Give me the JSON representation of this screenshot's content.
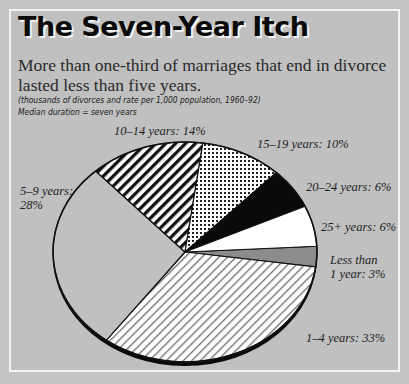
{
  "header": {
    "title": "The Seven-Year Itch",
    "subtitle": "More than one-third of marriages that end in divorce lasted less than five years.",
    "note1": "(thousands of divorces and rate per 1,000 population, 1960–92)",
    "note2": "Median duration = seven years"
  },
  "colors": {
    "background": "#c0c0c0",
    "frame": "#f4f4f4",
    "less_than_1_fill": "#8c8c8c",
    "stripe_dark": "#111111",
    "stripe_light": "#7a7a7a"
  },
  "labels": {
    "less_than_1_line1": "Less than",
    "less_than_1_line2": "1 year: 3%",
    "y1_4": "1–4 years: 33%",
    "y5_9_line1": "5–9 years:",
    "y5_9_line2": "28%",
    "y10_14": "10–14 years: 14%",
    "y15_19": "15–19 years: 10%",
    "y20_24": "20–24 years: 6%",
    "y25_plus": "25+ years: 6%"
  },
  "chart_data": {
    "type": "pie",
    "title": "The Seven-Year Itch",
    "subtitle": "More than one-third of marriages that end in divorce lasted less than five years.",
    "annotations": [
      "(thousands of divorces and rate per 1,000 population, 1960–92)",
      "Median duration = seven years"
    ],
    "categories": [
      "Less than 1 year",
      "1–4 years",
      "5–9 years",
      "10–14 years",
      "15–19 years",
      "20–24 years",
      "25+ years"
    ],
    "values": [
      3,
      33,
      28,
      14,
      10,
      6,
      6
    ],
    "unit": "%",
    "fills": [
      "gray",
      "thin-diagonal-lines",
      "background",
      "thick-diagonal-stripes",
      "dots",
      "black",
      "white"
    ],
    "start_angle_deg": -3,
    "direction": "clockwise",
    "legend": "none (direct labels)"
  }
}
